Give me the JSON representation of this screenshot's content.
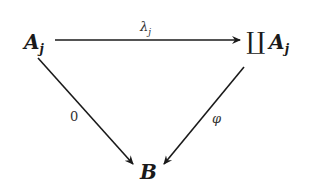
{
  "diagram": {
    "nodes": {
      "source": {
        "base": "A",
        "sub": "j"
      },
      "coproduct": {
        "symbol": "∐",
        "base": "A",
        "sub": "j"
      },
      "target": {
        "base": "B"
      }
    },
    "arrows": {
      "top": {
        "label_base": "λ",
        "label_sub": "j",
        "from": "source",
        "to": "coproduct"
      },
      "left": {
        "label": "0",
        "from": "source",
        "to": "target"
      },
      "right": {
        "label": "φ",
        "from": "coproduct",
        "to": "target"
      }
    }
  }
}
